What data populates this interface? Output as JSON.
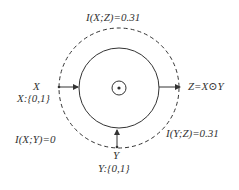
{
  "diagram": {
    "labels": {
      "top_mi": "I(X;Z)=0.31",
      "x_var": "X",
      "x_domain": "X:{0,1}",
      "z_output": "Z=X⊙Y",
      "xy_mi": "I(X;Y)=0",
      "yz_mi": "I(Y;Z)=0.31",
      "y_var": "Y",
      "y_domain": "Y:{0,1}"
    },
    "center_symbol": "circle-dot (XNOR operator)",
    "colors": {
      "stroke": "#333333",
      "text": "#333333",
      "background": "#ffffff"
    }
  }
}
